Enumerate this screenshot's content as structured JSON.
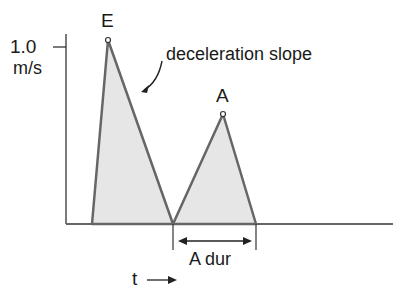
{
  "diagram": {
    "y_tick_value": "1.0",
    "y_tick_unit": "m/s",
    "peak_e_label": "E",
    "peak_a_label": "A",
    "annotation": "deceleration slope",
    "duration_label": "A dur",
    "x_axis_label": "t",
    "fill_color": "#e6e6e6",
    "line_color": "#666666"
  }
}
